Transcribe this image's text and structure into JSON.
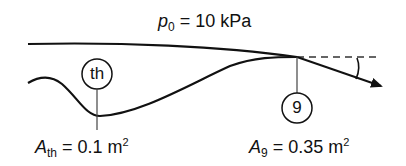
{
  "diagram": {
    "type": "nozzle-flow-schematic",
    "ambient_pressure": {
      "symbol": "p",
      "subscript": "0",
      "equals": "= 10 kPa"
    },
    "throat": {
      "station_label": "th",
      "area_symbol": "A",
      "area_subscript": "th",
      "area_value": "= 0.1 m",
      "area_exponent": "2"
    },
    "exit": {
      "station_label": "9",
      "area_symbol": "A",
      "area_subscript": "9",
      "area_value": "= 0.35 m",
      "area_exponent": "2"
    },
    "colors": {
      "stroke": "#111111",
      "background": "#ffffff"
    }
  }
}
